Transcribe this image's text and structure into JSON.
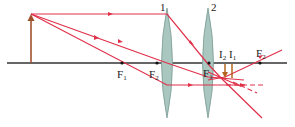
{
  "diagram": {
    "type": "two-lens optical system ray diagram",
    "colors": {
      "ray": "#e0304a",
      "axis": "#333333",
      "lens": "#9dbdb5",
      "lens_stroke": "#7a9c94",
      "object": "#a0522d",
      "image": "#b5651d"
    },
    "labels": {
      "lens1": "1",
      "lens2": "2",
      "F1_left": "F",
      "F1_left_sub": "1",
      "F2_left": "F",
      "F2_left_sub": "2",
      "F1_right": "F",
      "F1_right_sub": "1",
      "F2_right": "F",
      "F2_right_sub": "2",
      "I2": "I",
      "I2_sub": "2",
      "I1": "I",
      "I1_sub": "1"
    },
    "elements": {
      "optical_axis": {
        "x1": 7,
        "x2": 287,
        "y": 63
      },
      "object_arrow": {
        "x": 31,
        "y_base": 63,
        "y_tip": 14
      },
      "lens1": {
        "cx": 167,
        "top": 8,
        "bottom": 118
      },
      "lens2": {
        "cx": 208,
        "top": 8,
        "bottom": 118
      },
      "focal_points": [
        {
          "name": "F1",
          "x": 122
        },
        {
          "name": "F2",
          "x": 157
        },
        {
          "name": "F1",
          "x": 209
        },
        {
          "name": "F2",
          "x": 260
        }
      ],
      "images": [
        {
          "name": "I2",
          "x": 225,
          "y_top": 64,
          "y_tip": 78
        },
        {
          "name": "I1",
          "x": 232,
          "y_top": 64,
          "y_tip": 78
        }
      ]
    }
  }
}
